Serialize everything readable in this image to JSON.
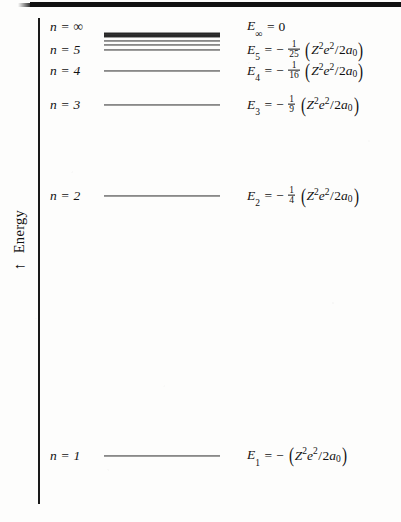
{
  "figure": {
    "background_color": "#fdfdfc",
    "ink_color": "#111111"
  },
  "axis": {
    "label": "Energy",
    "arrow_glyph": "↑",
    "orientation": "vertical",
    "direction": "increasing-upward"
  },
  "chart_data": {
    "type": "line",
    "xlabel": "",
    "ylabel": "Energy",
    "grid": false,
    "legend": "none",
    "levels": [
      {
        "n_label": "n = ∞",
        "n": "∞",
        "y_px": 27,
        "line": false,
        "E_symbol": "E",
        "E_subscript": "∞",
        "relative_energy": 0,
        "formula_plain": "E∞ = 0",
        "fraction": null,
        "has_parens": false,
        "group": ""
      },
      {
        "n_label": "",
        "n": "continuum",
        "y_px": 35,
        "line": true,
        "line_style": "continuum-band",
        "formula_plain": "",
        "fraction": null
      },
      {
        "n_label": "",
        "n": "9",
        "y_px": 41,
        "line": true,
        "line_style": "thin",
        "formula_plain": "",
        "fraction": null
      },
      {
        "n_label": "",
        "n": "8",
        "y_px": 44.5,
        "line": true,
        "line_style": "thin",
        "formula_plain": "",
        "fraction": null
      },
      {
        "n_label": "n = 5",
        "n": "5",
        "y_px": 50,
        "line": true,
        "line_style": "thin",
        "E_symbol": "E",
        "E_subscript": "5",
        "relative_energy": -0.04,
        "formula_plain": "E5 = −(1/25)(Z²e²/2a₀)",
        "fraction": {
          "num": "1",
          "den": "25"
        },
        "has_parens": true,
        "group": "Z²e²/2a₀"
      },
      {
        "n_label": "n = 4",
        "n": "4",
        "y_px": 71,
        "line": true,
        "line_style": "thin",
        "E_symbol": "E",
        "E_subscript": "4",
        "relative_energy": -0.0625,
        "formula_plain": "E4 = −(1/16)(Z²e²/2a₀)",
        "fraction": {
          "num": "1",
          "den": "16"
        },
        "has_parens": true,
        "group": "Z²e²/2a₀"
      },
      {
        "n_label": "n = 3",
        "n": "3",
        "y_px": 105,
        "line": true,
        "line_style": "thin",
        "E_symbol": "E",
        "E_subscript": "3",
        "relative_energy": -0.1111,
        "formula_plain": "E3 = −(1/9)(Z²e²/2a₀)",
        "fraction": {
          "num": "1",
          "den": "9"
        },
        "has_parens": true,
        "group": "Z²e²/2a₀"
      },
      {
        "n_label": "n = 2",
        "n": "2",
        "y_px": 196,
        "line": true,
        "line_style": "thin",
        "E_symbol": "E",
        "E_subscript": "2",
        "relative_energy": -0.25,
        "formula_plain": "E2 = −(1/4)(Z²e²/2a₀)",
        "fraction": {
          "num": "1",
          "den": "4"
        },
        "has_parens": true,
        "group": "Z²e²/2a₀"
      },
      {
        "n_label": "n = 1",
        "n": "1",
        "y_px": 456,
        "line": true,
        "line_style": "thin",
        "E_symbol": "E",
        "E_subscript": "1",
        "relative_energy": -1,
        "formula_plain": "E1 = −(Z²e²/2a₀)",
        "fraction": null,
        "has_parens": true,
        "group": "Z²e²/2a₀"
      }
    ],
    "notation": {
      "Z": "Z",
      "e": "e",
      "a0": "a₀",
      "exponent": "2",
      "equals": "=",
      "minus": "−",
      "n_symbol": "n",
      "infinity": "∞",
      "slash": "/",
      "denominator_prefix": "2"
    }
  }
}
